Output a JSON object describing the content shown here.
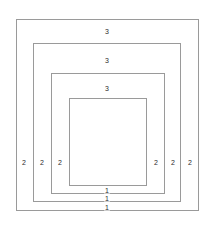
{
  "figure": {
    "background_color": "#ffffff",
    "line_color": "#9a9a9a",
    "label_color": "#2b2b2b",
    "canvas": {
      "width": 214,
      "height": 230
    }
  },
  "rectangles": [
    {
      "name": "outer-rectangle",
      "x": 16,
      "y": 19,
      "width": 183,
      "height": 192
    },
    {
      "name": "second-rectangle",
      "x": 33,
      "y": 43,
      "width": 148,
      "height": 159
    },
    {
      "name": "third-rectangle",
      "x": 51,
      "y": 73,
      "width": 114,
      "height": 121
    },
    {
      "name": "inner-rectangle",
      "x": 69,
      "y": 98,
      "width": 78,
      "height": 88
    }
  ],
  "labels": {
    "top": [
      {
        "name": "top-gap-label-1",
        "text": "3",
        "x": 107,
        "y": 31
      },
      {
        "name": "top-gap-label-2",
        "text": "3",
        "x": 107,
        "y": 60
      },
      {
        "name": "top-gap-label-3",
        "text": "3",
        "x": 107,
        "y": 88
      }
    ],
    "bottom": [
      {
        "name": "bottom-gap-label-1",
        "text": "1",
        "x": 107,
        "y": 190
      },
      {
        "name": "bottom-gap-label-2",
        "text": "1",
        "x": 107,
        "y": 198
      },
      {
        "name": "bottom-gap-label-3",
        "text": "1",
        "x": 107,
        "y": 207
      }
    ],
    "left": [
      {
        "name": "left-gap-label-1",
        "text": "2",
        "x": 24,
        "y": 162
      },
      {
        "name": "left-gap-label-2",
        "text": "2",
        "x": 42,
        "y": 162
      },
      {
        "name": "left-gap-label-3",
        "text": "2",
        "x": 60,
        "y": 162
      }
    ],
    "right": [
      {
        "name": "right-gap-label-1",
        "text": "2",
        "x": 156,
        "y": 162
      },
      {
        "name": "right-gap-label-2",
        "text": "2",
        "x": 173,
        "y": 162
      },
      {
        "name": "right-gap-label-3",
        "text": "2",
        "x": 190,
        "y": 162
      }
    ]
  }
}
